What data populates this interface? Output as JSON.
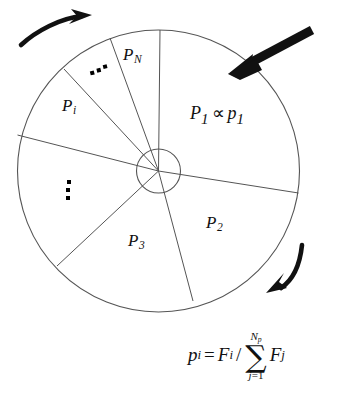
{
  "figure": {
    "wheel": {
      "center_x": 158.5,
      "center_y": 171,
      "outer_radius": 141,
      "hub_radius": 22,
      "stroke_color": "#555555",
      "fill_color": "#ffffff"
    },
    "sector_labels": [
      {
        "name": "sector-label-p1",
        "base": "P",
        "sub": "1",
        "x": 196,
        "y": 106
      },
      {
        "name": "sector-label-p2",
        "base": "P",
        "sub": "2",
        "x": 210,
        "y": 222
      },
      {
        "name": "sector-label-p3",
        "base": "P",
        "sub": "3",
        "x": 133,
        "y": 240
      },
      {
        "name": "sector-label-pi",
        "base": "P",
        "sub": "i",
        "x": 71,
        "y": 105
      },
      {
        "name": "sector-label-pn",
        "base": "P",
        "sub": "N",
        "x": 126,
        "y": 55
      }
    ],
    "proportional_label": {
      "name": "proportionality-label",
      "left_base": "P",
      "left_sub": "1",
      "operator": "∝",
      "right_base": "p",
      "right_sub": "1",
      "x": 196,
      "y": 106
    },
    "ellipses": [
      {
        "name": "ellipsis-upper-dots",
        "orientation": "horizontal",
        "x": 92,
        "y": 68,
        "rotation_deg": -14
      },
      {
        "name": "ellipsis-left-dots",
        "orientation": "vertical",
        "x": 67,
        "y": 186,
        "rotation_deg": 0
      }
    ],
    "arrows": [
      {
        "name": "selection-pointer-arrow",
        "style": "straight-thick",
        "color": "#111111",
        "from_x": 311,
        "from_y": 31,
        "to_x": 233,
        "to_y": 72
      },
      {
        "name": "rotation-arrow-top-left",
        "style": "curved",
        "color": "#111111",
        "direction": "clockwise"
      },
      {
        "name": "rotation-arrow-bottom-right",
        "style": "curved",
        "color": "#111111",
        "direction": "clockwise"
      }
    ],
    "formula": {
      "name": "probability-formula",
      "lhs_base": "p",
      "lhs_sub": "i",
      "equals": "=",
      "num_base": "F",
      "num_sub": "i",
      "slash": "/",
      "sum_symbol": "∑",
      "sum_upper_base": "N",
      "sum_upper_sub": "p",
      "sum_lower": "j 1",
      "sum_lower_var": "j",
      "sum_lower_eq": "=",
      "sum_lower_val": "1",
      "term_base": "F",
      "term_sub": "j",
      "plain_text": "p_i = F_i / ∑_{j=1}^{N_p} F_j"
    }
  }
}
